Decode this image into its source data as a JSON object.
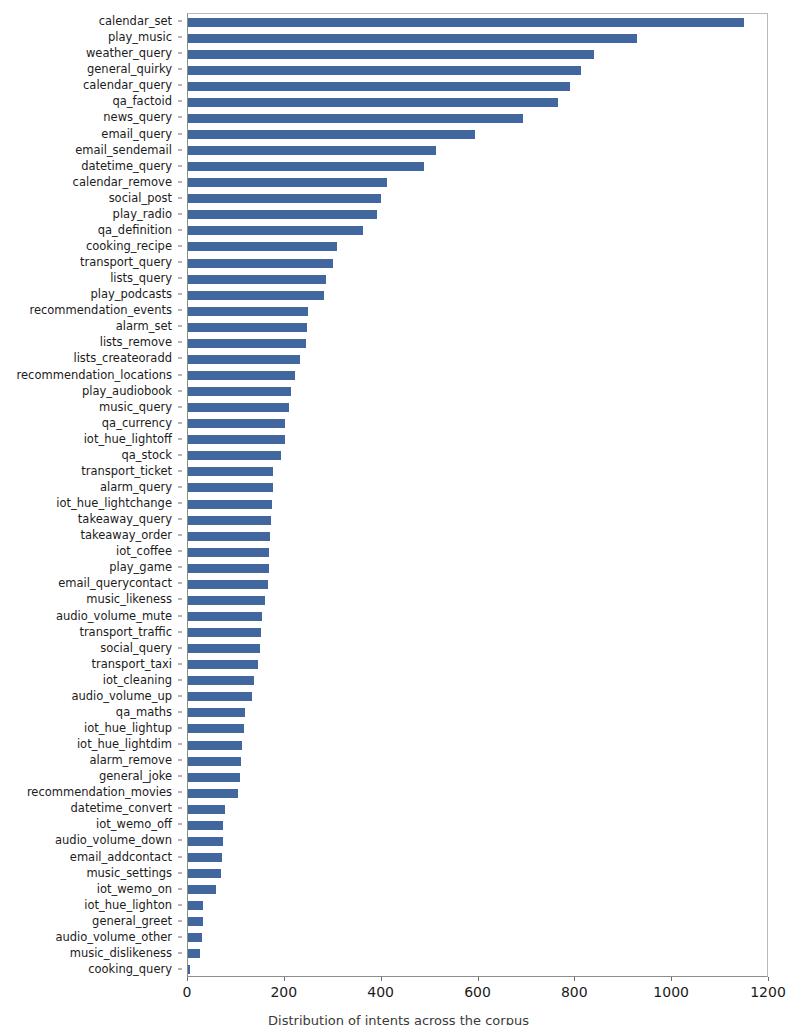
{
  "chart_data": {
    "type": "bar",
    "orientation": "horizontal",
    "title": "",
    "xlabel": "",
    "ylabel": "",
    "xlim": [
      0,
      1200
    ],
    "ylim": [
      0,
      57
    ],
    "grid": false,
    "legend": null,
    "bar_color": "#42679f",
    "xticks": [
      0,
      200,
      400,
      600,
      800,
      1000,
      1200
    ],
    "xtick_labels": [
      "0",
      "200",
      "400",
      "600",
      "800",
      "1000",
      "1200"
    ],
    "categories": [
      "calendar_set",
      "play_music",
      "weather_query",
      "general_quirky",
      "calendar_query",
      "qa_factoid",
      "news_query",
      "email_query",
      "email_sendemail",
      "datetime_query",
      "calendar_remove",
      "social_post",
      "play_radio",
      "qa_definition",
      "cooking_recipe",
      "transport_query",
      "lists_query",
      "play_podcasts",
      "recommendation_events",
      "alarm_set",
      "lists_remove",
      "lists_createoradd",
      "recommendation_locations",
      "play_audiobook",
      "music_query",
      "qa_currency",
      "iot_hue_lightoff",
      "qa_stock",
      "transport_ticket",
      "alarm_query",
      "iot_hue_lightchange",
      "takeaway_query",
      "takeaway_order",
      "iot_coffee",
      "play_game",
      "email_querycontact",
      "music_likeness",
      "audio_volume_mute",
      "transport_traffic",
      "social_query",
      "transport_taxi",
      "iot_cleaning",
      "audio_volume_up",
      "qa_maths",
      "iot_hue_lightup",
      "iot_hue_lightdim",
      "alarm_remove",
      "general_joke",
      "recommendation_movies",
      "datetime_convert",
      "iot_wemo_off",
      "audio_volume_down",
      "email_addcontact",
      "music_settings",
      "iot_wemo_on",
      "iot_hue_lighton",
      "general_greet",
      "audio_volume_other",
      "music_dislikeness",
      "cooking_query"
    ],
    "values": [
      1148,
      928,
      838,
      812,
      790,
      765,
      692,
      592,
      512,
      487,
      412,
      398,
      390,
      362,
      308,
      300,
      285,
      280,
      247,
      245,
      243,
      232,
      222,
      212,
      208,
      200,
      200,
      192,
      176,
      175,
      173,
      172,
      170,
      168,
      167,
      165,
      160,
      152,
      150,
      148,
      145,
      136,
      132,
      117,
      115,
      112,
      110,
      107,
      104,
      76,
      73,
      72,
      70,
      68,
      58,
      32,
      30,
      28,
      25,
      5
    ]
  },
  "caption": {
    "text": "Distribution of intents across the corpus"
  }
}
